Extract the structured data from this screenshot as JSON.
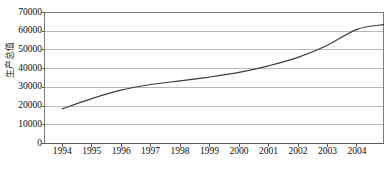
{
  "chart_data": {
    "type": "line",
    "title": "",
    "xlabel": "",
    "ylabel": "生产总值",
    "x": [
      1994,
      1995,
      1996,
      1997,
      1998,
      1999,
      2000,
      2001,
      2002,
      2003,
      2004
    ],
    "categories": [
      "1994",
      "1995",
      "1996",
      "1997",
      "1998",
      "1999",
      "2000",
      "2001",
      "2002",
      "2003",
      "2004"
    ],
    "values": [
      18500,
      24000,
      28500,
      31500,
      33500,
      35500,
      38000,
      41500,
      46000,
      52500,
      61000
    ],
    "series": [
      {
        "name": "生产总值",
        "values": [
          18500,
          24000,
          28500,
          31500,
          33500,
          35500,
          38000,
          41500,
          46000,
          52500,
          61000
        ]
      }
    ],
    "line_end_value": 63500,
    "ylim": [
      0,
      70000
    ],
    "ytick_step": 10000,
    "yticks": [
      0,
      10000,
      20000,
      30000,
      40000,
      50000,
      60000,
      70000
    ],
    "ytick_labels": [
      "0",
      "10000",
      "20000",
      "30000",
      "40000",
      "50000",
      "60000",
      "70000"
    ],
    "xlim": [
      1993.4,
      2004.9
    ],
    "grid": true,
    "grid_axis": "y",
    "legend": false,
    "legend_position": "none",
    "colors": {
      "line": "#3c3c3c",
      "grid": "#b9b9b9",
      "axis": "#7a7a7a",
      "background": "#ffffff",
      "text": "#0d0d0d"
    }
  }
}
